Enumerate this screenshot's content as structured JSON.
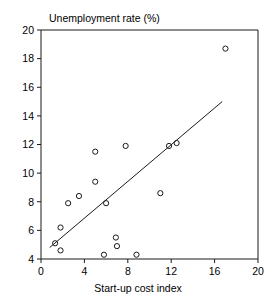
{
  "chart_data": {
    "type": "scatter",
    "title": "",
    "xlabel": "Start-up cost index",
    "ylabel": "Unemployment rate (%)",
    "ylabel_position": "top-left-horizontal",
    "xlim": [
      0,
      20
    ],
    "ylim": [
      4,
      20
    ],
    "xticks": [
      0,
      4,
      8,
      12,
      16,
      20
    ],
    "yticks": [
      4,
      6,
      8,
      10,
      12,
      14,
      16,
      18,
      20
    ],
    "xtick_labels": [
      "0",
      "4",
      "8",
      "12",
      "16",
      "20"
    ],
    "ytick_labels": [
      "4",
      "6",
      "8",
      "10",
      "12",
      "14",
      "16",
      "18",
      "20"
    ],
    "grid": false,
    "legend": null,
    "marker_style": "open-circle",
    "points": [
      {
        "x": 1.3,
        "y": 5.1
      },
      {
        "x": 1.8,
        "y": 4.6
      },
      {
        "x": 1.8,
        "y": 6.2
      },
      {
        "x": 2.5,
        "y": 7.9
      },
      {
        "x": 3.5,
        "y": 8.4
      },
      {
        "x": 5.0,
        "y": 9.4
      },
      {
        "x": 5.0,
        "y": 11.5
      },
      {
        "x": 5.8,
        "y": 4.3
      },
      {
        "x": 6.0,
        "y": 7.9
      },
      {
        "x": 6.9,
        "y": 5.5
      },
      {
        "x": 7.0,
        "y": 4.9
      },
      {
        "x": 7.8,
        "y": 11.9
      },
      {
        "x": 8.8,
        "y": 4.3
      },
      {
        "x": 11.0,
        "y": 8.6
      },
      {
        "x": 11.8,
        "y": 11.9
      },
      {
        "x": 12.5,
        "y": 12.1
      },
      {
        "x": 17.0,
        "y": 18.7
      }
    ],
    "trendline": {
      "type": "linear-fit",
      "x_start": 0.8,
      "y_start": 4.8,
      "x_end": 16.7,
      "y_end": 15.0
    }
  },
  "colors": {
    "ink": "#1a1a1a",
    "background": "#ffffff"
  }
}
